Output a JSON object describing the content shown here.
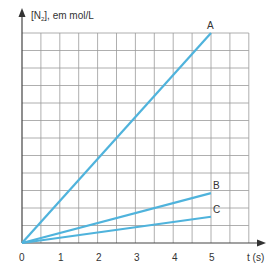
{
  "chart_data": {
    "type": "line",
    "title": "",
    "xlabel": "t (s)",
    "ylabel": "[N2], em mol/L",
    "xlim": [
      0,
      6
    ],
    "ylim": [
      0,
      12
    ],
    "x_ticks": [
      "0",
      "1",
      "2",
      "3",
      "4",
      "5"
    ],
    "grid": true,
    "series": [
      {
        "name": "A",
        "x": [
          0,
          5
        ],
        "y": [
          0,
          12
        ]
      },
      {
        "name": "B",
        "x": [
          0,
          5
        ],
        "y": [
          0,
          2.85
        ]
      },
      {
        "name": "C",
        "x": [
          0,
          5
        ],
        "y": [
          0,
          1.5
        ]
      }
    ],
    "line_color": "#4fb3dc",
    "grid_color": "#9a9a9a"
  },
  "labels": {
    "ylabel_prefix": "[N",
    "ylabel_sub": "2",
    "ylabel_suffix": "], em mol/L",
    "xlabel": "t (s)",
    "series_A": "A",
    "series_B": "B",
    "series_C": "C",
    "tick_0": "0",
    "tick_1": "1",
    "tick_2": "2",
    "tick_3": "3",
    "tick_4": "4",
    "tick_5": "5"
  }
}
